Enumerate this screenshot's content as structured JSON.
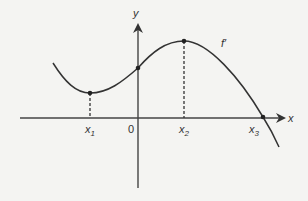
{
  "diagram": {
    "function_label": "f′",
    "axis_labels": {
      "x": "x",
      "y": "y"
    },
    "origin_label": "0",
    "points": [
      {
        "name": "x",
        "sub": "1",
        "description": "local minimum of f′"
      },
      {
        "name": "x",
        "sub": "2",
        "description": "local maximum of f′"
      },
      {
        "name": "x",
        "sub": "3",
        "description": "zero of f′"
      }
    ],
    "colors": {
      "stroke": "#333333",
      "background": "#f4f4f2"
    }
  }
}
